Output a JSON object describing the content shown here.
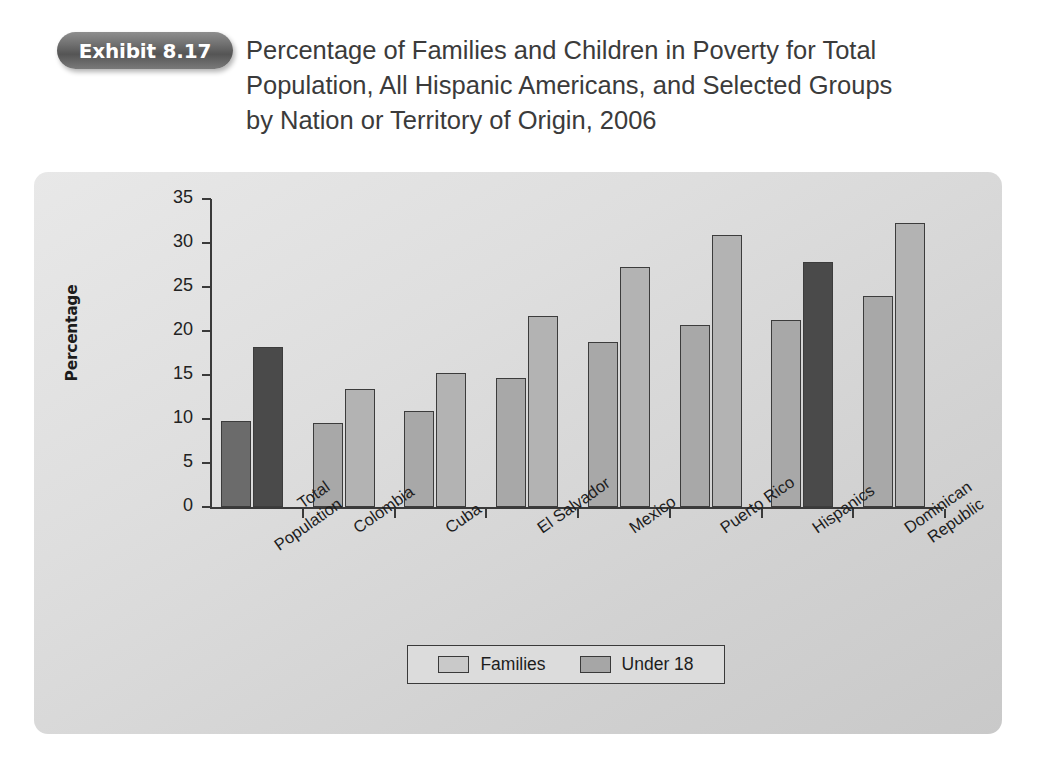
{
  "exhibit": {
    "badge_label": "Exhibit 8.17",
    "title": "Percentage of Families and Children in Poverty for Total\nPopulation, All Hispanic Americans, and Selected Groups\nby Nation or Territory of Origin, 2006"
  },
  "chart_data": {
    "type": "bar",
    "title": "Percentage of Families and Children in Poverty for Total Population, All Hispanic Americans, and Selected Groups by Nation or Territory of Origin, 2006",
    "xlabel": "",
    "ylabel": "Percentage",
    "ylim": [
      0,
      35
    ],
    "yticks": [
      0,
      5,
      10,
      15,
      20,
      25,
      30,
      35
    ],
    "ytick_labels": [
      "0",
      "5",
      "10",
      "15",
      "20",
      "25",
      "30",
      "35"
    ],
    "grid": false,
    "legend_position": "bottom",
    "categories": [
      "Total\nPopulation",
      "Colombia",
      "Cuba",
      "El Salvador",
      "Mexico",
      "Puerto Rico",
      "Hispanics",
      "Dominican\nRepublic"
    ],
    "series": [
      {
        "name": "Families",
        "values": [
          9.8,
          9.6,
          10.9,
          14.7,
          18.8,
          20.7,
          21.3,
          24.0
        ]
      },
      {
        "name": "Under 18",
        "values": [
          18.2,
          13.4,
          15.2,
          21.7,
          27.3,
          30.9,
          27.8,
          32.3
        ]
      }
    ],
    "highlighted": [
      {
        "category": "Total\nPopulation",
        "series": "Families"
      },
      {
        "category": "Total\nPopulation",
        "series": "Under 18"
      },
      {
        "category": "Hispanics",
        "series": "Under 18"
      }
    ]
  },
  "colors": {
    "families_bar": "#a8a8a8",
    "under18_bar": "#b3b3b3",
    "highlight_bar": "#4a4a4a",
    "axis": "#3a3a3a",
    "panel_background": "#dedede",
    "badge": "#6e6e6e",
    "title_text": "#3b3b3b"
  }
}
